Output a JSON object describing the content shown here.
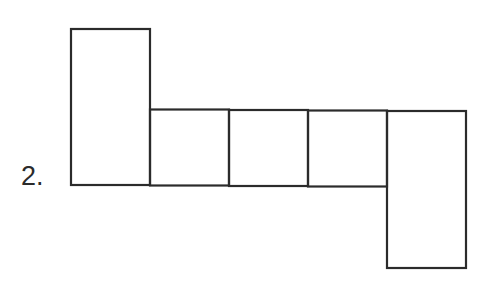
{
  "problem": {
    "number_label": "2."
  },
  "diagram": {
    "stroke_color": "#2b2b2b",
    "faces": [
      {
        "name": "face-left-tall",
        "x": 71,
        "y": 29,
        "w": 79,
        "h": 156
      },
      {
        "name": "face-square-1",
        "x": 150,
        "y": 109,
        "w": 79,
        "h": 76
      },
      {
        "name": "face-square-2",
        "x": 229,
        "y": 109,
        "w": 79,
        "h": 77
      },
      {
        "name": "face-square-3",
        "x": 308,
        "y": 110,
        "w": 79,
        "h": 76
      },
      {
        "name": "face-right-tall",
        "x": 387,
        "y": 111,
        "w": 79,
        "h": 157
      }
    ]
  }
}
